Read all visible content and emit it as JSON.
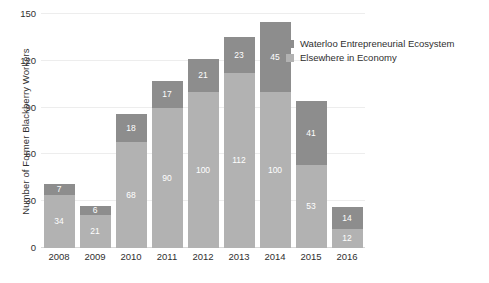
{
  "chart_data": {
    "type": "bar",
    "subtype": "stacked-vertical",
    "title": "",
    "xlabel": "",
    "ylabel": "Number of Former Blackberry Workers",
    "categories": [
      "2008",
      "2009",
      "2010",
      "2011",
      "2012",
      "2013",
      "2014",
      "2015",
      "2016"
    ],
    "series": [
      {
        "name": "Waterloo Entrepreneurial Ecosystem",
        "color": "#8d8d8d",
        "values": [
          7,
          6,
          18,
          17,
          21,
          23,
          45,
          41,
          14
        ]
      },
      {
        "name": "Elsewhere in Economy",
        "color": "#b2b2b2",
        "values": [
          34,
          21,
          68,
          90,
          100,
          112,
          100,
          53,
          12
        ]
      }
    ],
    "totals": [
      41,
      27,
      86,
      107,
      121,
      135,
      145,
      94,
      26
    ],
    "ylim": [
      0,
      150
    ],
    "yticks": [
      0,
      30,
      60,
      90,
      120,
      150
    ],
    "ytick_labels": [
      "0",
      "30",
      "60",
      "90",
      "120",
      "150"
    ],
    "grid": true,
    "grid_axis": "y",
    "legend_position": "top-right",
    "data_labels": true
  },
  "legend": {
    "items": [
      {
        "label": "Waterloo Entrepreneurial Ecosystem"
      },
      {
        "label": "Elsewhere in Economy"
      }
    ]
  }
}
